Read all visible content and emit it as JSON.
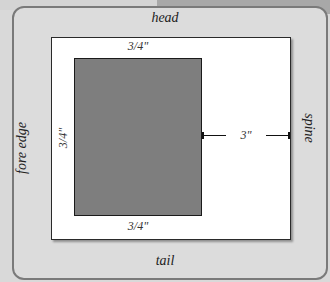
{
  "diagram": {
    "edges": {
      "head": "head",
      "tail": "tail",
      "fore_edge": "fore edge",
      "spine": "spine"
    },
    "margins": {
      "top": "3/4\"",
      "bottom": "3/4\"",
      "left": "3/4\"",
      "right": "3\""
    },
    "colors": {
      "panel": "#dcdcdc",
      "page": "#ffffff",
      "text_block": "#7e7e7e",
      "border": "#7a7a7a"
    }
  }
}
